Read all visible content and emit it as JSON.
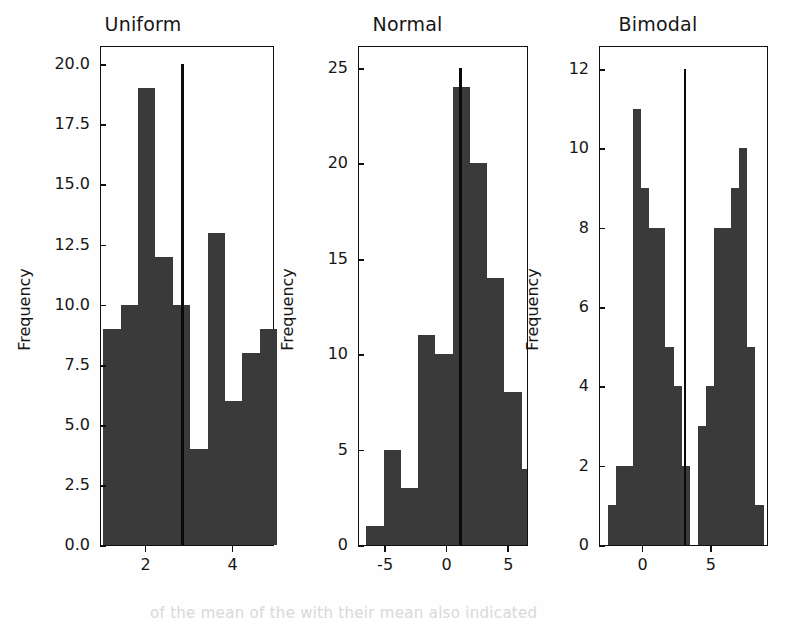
{
  "figure": {
    "background": "#ffffff",
    "bar_color": "#3a3a3a",
    "mean_line_color": "#0a0a0a",
    "axis_color": "#111111",
    "bleed_text": "of the mean of the with their mean also indicated"
  },
  "chart_data": [
    {
      "type": "bar",
      "title": "Uniform",
      "xlabel": "",
      "ylabel": "Frequency",
      "grid": false,
      "legend": null,
      "xlim": [
        0.95,
        4.95
      ],
      "ylim": [
        0.0,
        20.8
      ],
      "xticks": [
        2,
        4
      ],
      "xtick_labels": [
        "2",
        "4"
      ],
      "yticks": [
        0.0,
        2.5,
        5.0,
        7.5,
        10.0,
        12.5,
        15.0,
        17.5,
        20.0
      ],
      "ytick_labels": [
        "0.0",
        "2.5",
        "5.0",
        "7.5",
        "10.0",
        "12.5",
        "15.0",
        "17.5",
        "20.0"
      ],
      "bin_edges": [
        1.0,
        1.4,
        1.8,
        2.2,
        2.6,
        3.0,
        3.4,
        3.8,
        4.2,
        4.6,
        5.0
      ],
      "values": [
        9,
        10,
        19,
        12,
        10,
        4,
        13,
        6,
        8,
        9
      ],
      "annotations": [
        {
          "name": "mean-line",
          "x": 2.82,
          "y_top": 20.0,
          "label": "mean"
        }
      ]
    },
    {
      "type": "bar",
      "title": "Normal",
      "xlabel": "",
      "ylabel": "Frequency",
      "grid": false,
      "legend": null,
      "xlim": [
        -7.2,
        6.6
      ],
      "ylim": [
        0,
        26.2
      ],
      "xticks": [
        -5,
        0,
        5
      ],
      "xtick_labels": [
        "-5",
        "0",
        "5"
      ],
      "yticks": [
        0,
        5,
        10,
        15,
        20,
        25
      ],
      "ytick_labels": [
        "0",
        "5",
        "10",
        "15",
        "20",
        "25"
      ],
      "bin_edges": [
        -6.6,
        -5.2,
        -3.8,
        -2.4,
        -1.0,
        0.4,
        1.8,
        3.2,
        4.6,
        6.0,
        6.4
      ],
      "values": [
        1,
        5,
        3,
        11,
        10,
        24,
        20,
        14,
        8,
        4
      ],
      "annotations": [
        {
          "name": "mean-line",
          "x": 1.05,
          "y_top": 25.0,
          "label": "mean"
        }
      ]
    },
    {
      "type": "bar",
      "title": "Bimodal",
      "xlabel": "",
      "ylabel": "Frequency",
      "grid": false,
      "legend": null,
      "xlim": [
        -3.2,
        9.2
      ],
      "ylim": [
        0,
        12.6
      ],
      "xticks": [
        0,
        5
      ],
      "xtick_labels": [
        "0",
        "5"
      ],
      "yticks": [
        0,
        2,
        4,
        6,
        8,
        10,
        12
      ],
      "ytick_labels": [
        "0",
        "2",
        "4",
        "6",
        "8",
        "10",
        "12"
      ],
      "bin_edges": [
        -2.6,
        -2.0,
        -1.4,
        -0.8,
        -0.2,
        0.4,
        1.0,
        1.6,
        2.2,
        2.8,
        3.4,
        4.0,
        4.6,
        5.2,
        5.8,
        6.4,
        7.0,
        7.6,
        8.2,
        8.8
      ],
      "values": [
        1,
        2,
        2,
        11,
        9,
        8,
        8,
        5,
        4,
        2,
        0,
        3,
        4,
        8,
        8,
        9,
        10,
        5,
        1,
        2
      ],
      "annotations": [
        {
          "name": "mean-line",
          "x": 3.05,
          "y_top": 12.0,
          "label": "mean"
        }
      ]
    }
  ]
}
